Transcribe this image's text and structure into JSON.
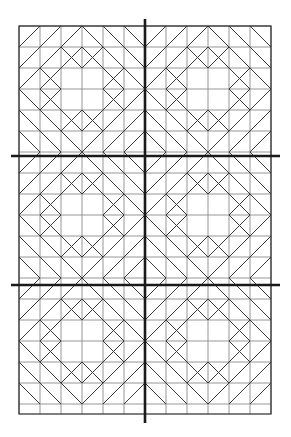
{
  "figure": {
    "canvas": {
      "width": 291,
      "height": 437,
      "background": "#ffffff"
    },
    "pattern_area": {
      "x": 19,
      "y": 26,
      "width": 252,
      "height": 388
    },
    "grid": {
      "cell_size": 21,
      "columns": 12,
      "rows": 18,
      "blocks_across": 2,
      "blocks_down": 3,
      "cells_per_block": 6
    },
    "colors": {
      "background": "#ffffff",
      "grid_line": "#8a8a8a",
      "diagonal_line": "#3a3a3a",
      "border_line": "#2b2b2b",
      "axis_line": "#1a1a1a"
    },
    "stroke_widths": {
      "grid_line": 0.9,
      "diagonal_line": 1.0,
      "border_line": 1.2,
      "axis_line": 2.6
    },
    "axes": [
      {
        "name": "vertical-center-axis",
        "orientation": "vertical",
        "position": 145,
        "start": 19,
        "end": 423
      },
      {
        "name": "horizontal-axis-upper",
        "orientation": "horizontal",
        "position": 156,
        "start": 11,
        "end": 280
      },
      {
        "name": "horizontal-axis-lower",
        "orientation": "horizontal",
        "position": 285,
        "start": 11,
        "end": 280
      }
    ]
  },
  "chart_data": {
    "type": "diagram",
    "subtitle": "",
    "xlabel": "",
    "ylabel": "",
    "legend": [],
    "annotations": [],
    "grid": true,
    "block_definition": {
      "size_cells": 6,
      "description": "Eight-pointed star motif drawn on a 6x6 unit grid; centre is a 2x2 open square, four corner quadrants each carry a nested chevron/diamond arrangement.",
      "quadrant_diagonals_unit": [
        [
          [
            3,
            0
          ],
          [
            0,
            3
          ]
        ],
        [
          [
            3,
            0
          ],
          [
            6,
            3
          ]
        ],
        [
          [
            0,
            3
          ],
          [
            3,
            6
          ]
        ],
        [
          [
            6,
            3
          ],
          [
            3,
            6
          ]
        ],
        [
          [
            1,
            0
          ],
          [
            0,
            1
          ]
        ],
        [
          [
            5,
            0
          ],
          [
            6,
            1
          ]
        ],
        [
          [
            0,
            5
          ],
          [
            1,
            6
          ]
        ],
        [
          [
            6,
            5
          ],
          [
            5,
            6
          ]
        ],
        [
          [
            2,
            0
          ],
          [
            0,
            2
          ]
        ],
        [
          [
            4,
            0
          ],
          [
            6,
            2
          ]
        ],
        [
          [
            0,
            4
          ],
          [
            2,
            6
          ]
        ],
        [
          [
            6,
            4
          ],
          [
            4,
            6
          ]
        ],
        [
          [
            2,
            1
          ],
          [
            1,
            2
          ]
        ],
        [
          [
            4,
            1
          ],
          [
            5,
            2
          ]
        ],
        [
          [
            1,
            4
          ],
          [
            2,
            5
          ]
        ],
        [
          [
            5,
            4
          ],
          [
            4,
            5
          ]
        ],
        [
          [
            3,
            1
          ],
          [
            1,
            3
          ]
        ],
        [
          [
            3,
            1
          ],
          [
            5,
            3
          ]
        ],
        [
          [
            1,
            3
          ],
          [
            3,
            5
          ]
        ],
        [
          [
            5,
            3
          ],
          [
            3,
            5
          ]
        ],
        [
          [
            2,
            1
          ],
          [
            3,
            2
          ]
        ],
        [
          [
            4,
            1
          ],
          [
            3,
            2
          ]
        ],
        [
          [
            1,
            2
          ],
          [
            2,
            3
          ]
        ],
        [
          [
            1,
            4
          ],
          [
            2,
            3
          ]
        ],
        [
          [
            5,
            2
          ],
          [
            4,
            3
          ]
        ],
        [
          [
            5,
            4
          ],
          [
            4,
            3
          ]
        ],
        [
          [
            2,
            5
          ],
          [
            3,
            4
          ]
        ],
        [
          [
            4,
            5
          ],
          [
            3,
            4
          ]
        ]
      ],
      "internal_grid_lines_unit": {
        "horizontal_rows": [
          1,
          2,
          3,
          4,
          5
        ],
        "vertical_cols": [
          1,
          2,
          3,
          4,
          5
        ]
      }
    },
    "counts": {
      "blocks_total": 6,
      "axis_lines": 3,
      "grid_columns": 12,
      "grid_rows": 18
    }
  }
}
